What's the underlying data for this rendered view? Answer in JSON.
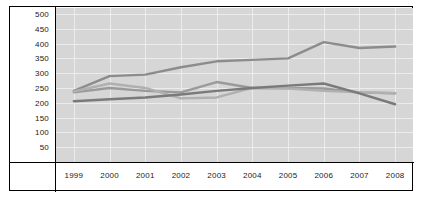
{
  "chart_data": {
    "type": "line",
    "title": "",
    "xlabel": "",
    "ylabel": "",
    "categories": [
      "1999",
      "2000",
      "2001",
      "2002",
      "2003",
      "2004",
      "2005",
      "2006",
      "2007",
      "2008"
    ],
    "x": [
      1999,
      2000,
      2001,
      2002,
      2003,
      2004,
      2005,
      2006,
      2007,
      2008
    ],
    "ylim": [
      0,
      520
    ],
    "yticks": [
      50,
      100,
      150,
      200,
      250,
      300,
      350,
      400,
      450,
      500
    ],
    "ytick_labels": [
      "50",
      "100",
      "150",
      "200",
      "250",
      "300",
      "350",
      "400",
      "450",
      "500"
    ],
    "grid": true,
    "legend": "none",
    "series": [
      {
        "name": "series-1",
        "color": "#8c8c8c",
        "width": 2.4,
        "values": [
          240,
          290,
          295,
          320,
          340,
          345,
          350,
          405,
          385,
          390
        ]
      },
      {
        "name": "series-2",
        "color": "#9a9a9a",
        "width": 2.4,
        "values": [
          235,
          250,
          240,
          235,
          270,
          250,
          250,
          248,
          235,
          232
        ]
      },
      {
        "name": "series-3",
        "color": "#b0b0b0",
        "width": 2.4,
        "values": [
          238,
          265,
          250,
          215,
          218,
          250,
          248,
          240,
          235,
          232
        ]
      },
      {
        "name": "series-4",
        "color": "#7a7a7a",
        "width": 2.4,
        "values": [
          205,
          212,
          218,
          228,
          240,
          250,
          258,
          265,
          232,
          195
        ]
      }
    ]
  },
  "axes": {
    "y_axis_name": "y-axis",
    "x_axis_name": "x-axis"
  }
}
